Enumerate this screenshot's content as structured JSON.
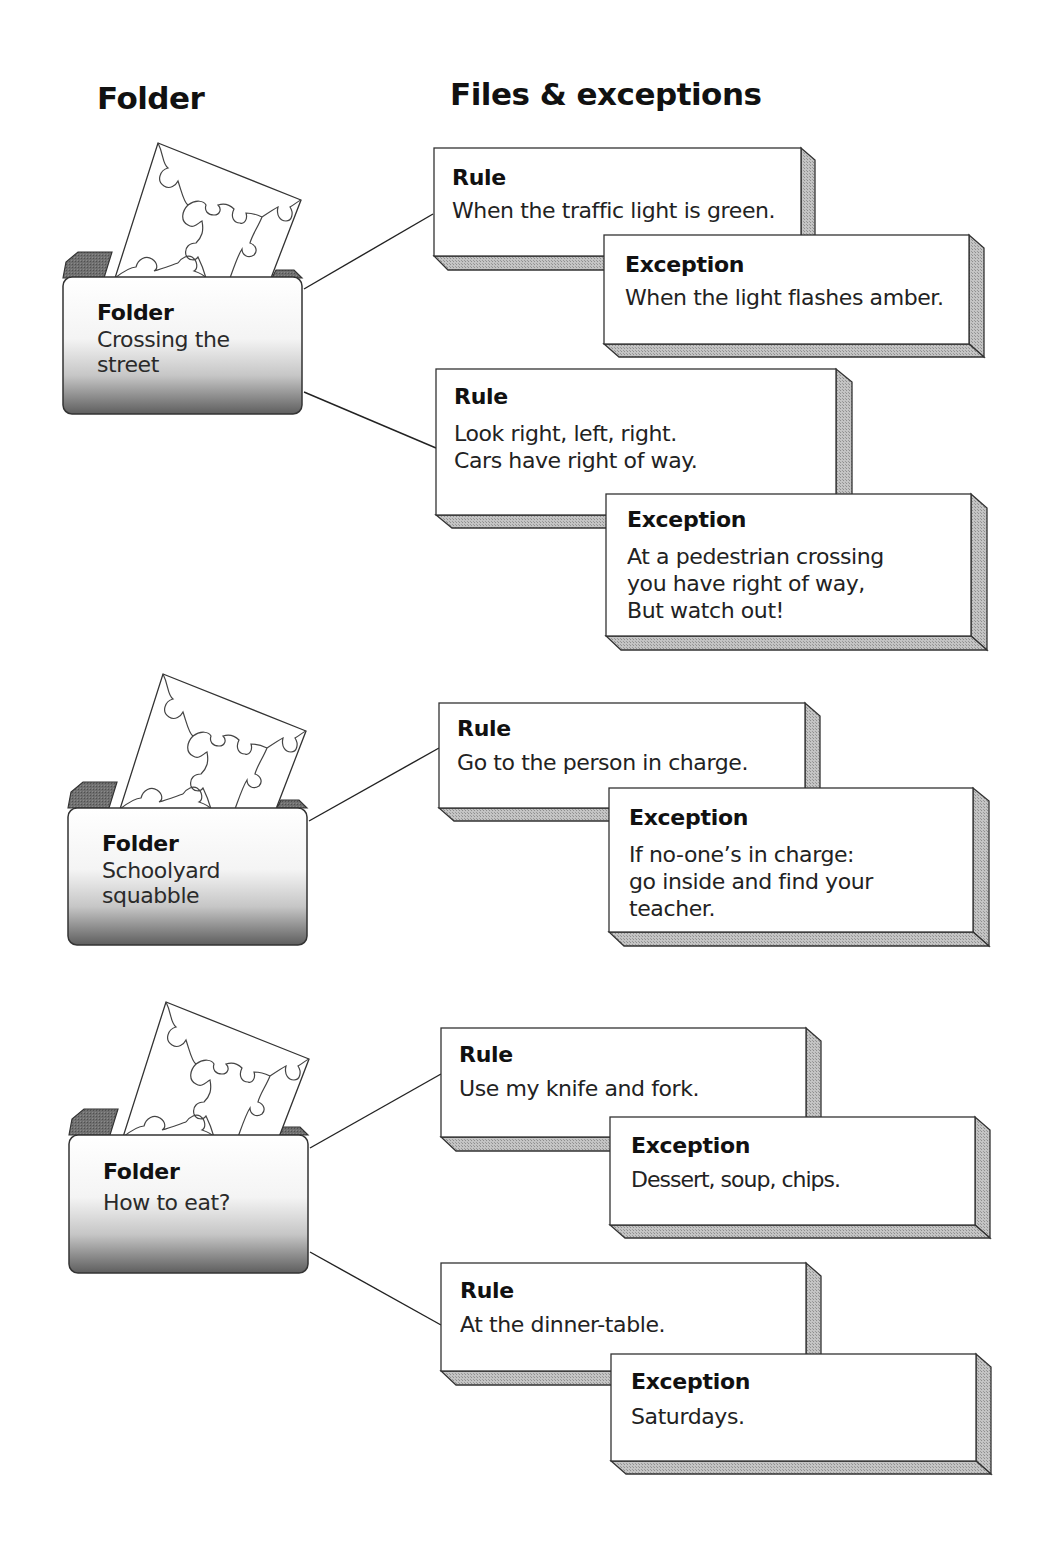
{
  "headers": {
    "folder_column": "Folder",
    "files_column": "Files & exceptions"
  },
  "colors": {
    "box_fill": "#ffffff",
    "box_stroke": "#333333",
    "extrusion_fill": "#b8b8b8",
    "folder_back": "#6e6e6e",
    "folder_gradient_top": "#ffffff",
    "folder_gradient_bottom": "#6a6a6a",
    "connector": "#222222"
  },
  "folders": [
    {
      "label": "Folder",
      "title": "Crossing the\nstreet",
      "icon": "puzzle-icon",
      "rules": [
        {
          "label": "Rule",
          "text": "When the traffic light is green.",
          "exception": {
            "label": "Exception",
            "text": "When the light flashes amber."
          }
        },
        {
          "label": "Rule",
          "text": "Look right, left, right.\nCars have right of way.",
          "exception": {
            "label": "Exception",
            "text": "At a pedestrian crossing\nyou have right of way,\nBut watch out!"
          }
        }
      ]
    },
    {
      "label": "Folder",
      "title": "Schoolyard\nsquabble",
      "icon": "puzzle-icon",
      "rules": [
        {
          "label": "Rule",
          "text": "Go to the person in charge.",
          "exception": {
            "label": "Exception",
            "text": " If no-one’s in charge:\ngo inside and find your\nteacher."
          }
        }
      ]
    },
    {
      "label": "Folder",
      "title": "How to eat?",
      "icon": "puzzle-icon",
      "rules": [
        {
          "label": "Rule",
          "text": "Use my knife and fork.",
          "exception": {
            "label": "Exception",
            "text": "Dessert, soup, chips."
          }
        },
        {
          "label": "Rule",
          "text": "At the dinner-table.",
          "exception": {
            "label": "Exception",
            "text": "Saturdays."
          }
        }
      ]
    }
  ]
}
